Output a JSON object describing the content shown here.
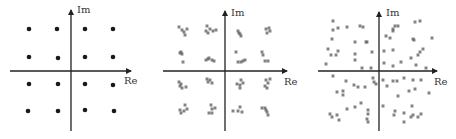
{
  "figure": {
    "axis_color": "#222222",
    "point_color_ideal": "#1a1a1a",
    "point_color_noisy": "#666666",
    "panels": [
      {
        "name": "ideal",
        "x_label": "Re",
        "y_label": "Im",
        "origin": [
          71,
          71
        ],
        "h_axis": [
          10,
          131
        ],
        "v_axis": [
          10,
          131
        ],
        "im_label_pos": [
          77,
          13
        ],
        "re_label_pos": [
          124,
          84
        ],
        "marker": "dot",
        "points": [
          [
            29,
            29
          ],
          [
            57,
            29
          ],
          [
            85,
            29
          ],
          [
            113,
            29
          ],
          [
            29,
            57
          ],
          [
            58,
            58
          ],
          [
            85,
            57
          ],
          [
            113,
            57
          ],
          [
            29,
            84
          ],
          [
            58,
            84
          ],
          [
            85,
            84
          ],
          [
            113,
            85
          ],
          [
            28,
            111
          ],
          [
            58,
            111
          ],
          [
            85,
            110
          ],
          [
            114,
            111
          ]
        ]
      },
      {
        "name": "moderate-noise",
        "x_label": "Re",
        "y_label": "Im",
        "origin": [
          225,
          71
        ],
        "h_axis": [
          163,
          287
        ],
        "v_axis": [
          11,
          131
        ],
        "im_label_pos": [
          231,
          16
        ],
        "re_label_pos": [
          284,
          85
        ],
        "marker": "star",
        "points": [
          [
            179,
            27
          ],
          [
            182,
            30
          ],
          [
            185,
            35
          ],
          [
            187,
            29
          ],
          [
            184,
            32
          ],
          [
            207,
            26
          ],
          [
            210,
            29
          ],
          [
            208,
            33
          ],
          [
            213,
            31
          ],
          [
            216,
            30
          ],
          [
            206,
            31
          ],
          [
            238,
            31
          ],
          [
            240,
            34
          ],
          [
            241,
            36
          ],
          [
            239,
            33
          ],
          [
            266,
            29
          ],
          [
            269,
            28
          ],
          [
            267,
            33
          ],
          [
            270,
            31
          ],
          [
            181,
            52
          ],
          [
            182,
            54
          ],
          [
            183,
            62
          ],
          [
            180,
            53
          ],
          [
            206,
            60
          ],
          [
            209,
            58
          ],
          [
            212,
            60
          ],
          [
            214,
            61
          ],
          [
            208,
            59
          ],
          [
            236,
            52
          ],
          [
            238,
            62
          ],
          [
            241,
            62
          ],
          [
            243,
            61
          ],
          [
            245,
            60
          ],
          [
            262,
            52
          ],
          [
            263,
            55
          ],
          [
            265,
            61
          ],
          [
            268,
            61
          ],
          [
            179,
            82
          ],
          [
            180,
            86
          ],
          [
            182,
            88
          ],
          [
            186,
            87
          ],
          [
            181,
            84
          ],
          [
            207,
            79
          ],
          [
            210,
            80
          ],
          [
            212,
            83
          ],
          [
            208,
            82
          ],
          [
            237,
            84
          ],
          [
            240,
            85
          ],
          [
            240,
            88
          ],
          [
            241,
            80
          ],
          [
            243,
            83
          ],
          [
            266,
            80
          ],
          [
            268,
            83
          ],
          [
            267,
            88
          ],
          [
            270,
            79
          ],
          [
            265,
            86
          ],
          [
            185,
            105
          ],
          [
            180,
            110
          ],
          [
            181,
            113
          ],
          [
            184,
            111
          ],
          [
            187,
            109
          ],
          [
            211,
            105
          ],
          [
            212,
            109
          ],
          [
            215,
            108
          ],
          [
            209,
            113
          ],
          [
            212,
            113
          ],
          [
            233,
            111
          ],
          [
            240,
            107
          ],
          [
            242,
            112
          ],
          [
            238,
            111
          ],
          [
            262,
            108
          ],
          [
            265,
            108
          ],
          [
            267,
            112
          ],
          [
            268,
            115
          ],
          [
            266,
            110
          ]
        ]
      },
      {
        "name": "heavy-noise",
        "x_label": "Re",
        "y_label": "Im",
        "origin": [
          379,
          71
        ],
        "h_axis": [
          318,
          437
        ],
        "v_axis": [
          12,
          131
        ],
        "im_label_pos": [
          386,
          16
        ],
        "re_label_pos": [
          434,
          85
        ],
        "marker": "star",
        "points": [
          [
            333,
            21
          ],
          [
            333,
            30
          ],
          [
            338,
            28
          ],
          [
            347,
            27
          ],
          [
            360,
            26
          ],
          [
            363,
            27
          ],
          [
            332,
            39
          ],
          [
            355,
            42
          ],
          [
            366,
            42
          ],
          [
            367,
            42
          ],
          [
            328,
            49
          ],
          [
            331,
            55
          ],
          [
            336,
            55
          ],
          [
            338,
            51
          ],
          [
            355,
            54
          ],
          [
            372,
            52
          ],
          [
            326,
            64
          ],
          [
            355,
            60
          ],
          [
            362,
            68
          ],
          [
            371,
            68
          ],
          [
            415,
            22
          ],
          [
            420,
            21
          ],
          [
            395,
            26
          ],
          [
            393,
            29
          ],
          [
            393,
            31
          ],
          [
            398,
            26
          ],
          [
            386,
            36
          ],
          [
            390,
            38
          ],
          [
            413,
            39
          ],
          [
            414,
            40
          ],
          [
            432,
            38
          ],
          [
            384,
            51
          ],
          [
            393,
            50
          ],
          [
            418,
            55
          ],
          [
            420,
            52
          ],
          [
            423,
            49
          ],
          [
            411,
            58
          ],
          [
            384,
            63
          ],
          [
            393,
            66
          ],
          [
            401,
            62
          ],
          [
            416,
            65
          ],
          [
            426,
            68
          ],
          [
            333,
            76
          ],
          [
            346,
            81
          ],
          [
            354,
            85
          ],
          [
            358,
            87
          ],
          [
            365,
            87
          ],
          [
            337,
            92
          ],
          [
            343,
            91
          ],
          [
            343,
            95
          ],
          [
            373,
            78
          ],
          [
            374,
            82
          ],
          [
            376,
            84
          ],
          [
            383,
            80
          ],
          [
            387,
            86
          ],
          [
            393,
            81
          ],
          [
            397,
            81
          ],
          [
            404,
            78
          ],
          [
            413,
            80
          ],
          [
            421,
            80
          ],
          [
            409,
            91
          ],
          [
            415,
            89
          ],
          [
            429,
            93
          ],
          [
            398,
            96
          ],
          [
            347,
            109
          ],
          [
            355,
            107
          ],
          [
            361,
            103
          ],
          [
            368,
            110
          ],
          [
            368,
            114
          ],
          [
            367,
            119
          ],
          [
            330,
            114
          ],
          [
            332,
            117
          ],
          [
            337,
            115
          ],
          [
            339,
            120
          ],
          [
            383,
            106
          ],
          [
            395,
            111
          ],
          [
            394,
            115
          ],
          [
            404,
            113
          ],
          [
            412,
            106
          ],
          [
            413,
            115
          ],
          [
            411,
            117
          ],
          [
            421,
            114
          ],
          [
            418,
            117
          ],
          [
            404,
            122
          ],
          [
            368,
            122
          ]
        ]
      }
    ]
  }
}
